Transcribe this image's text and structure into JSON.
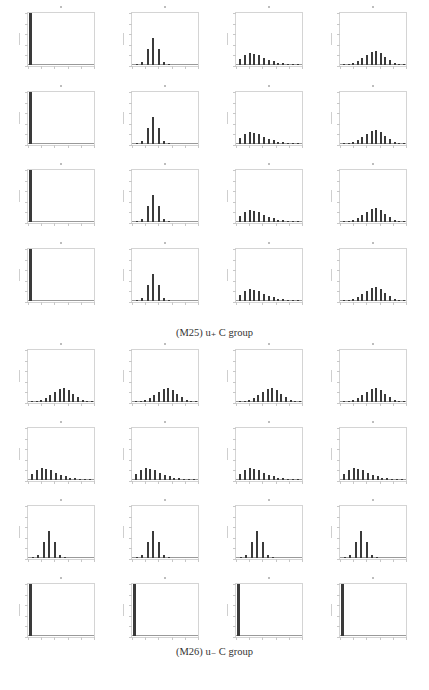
{
  "figure": {
    "captions": [
      {
        "label": "(M25) u₊ C group"
      },
      {
        "label": "(M26) u₋ C group"
      }
    ]
  },
  "chart_data": [
    {
      "type": "bar",
      "title": "(M25) u₊ C group",
      "layout": "4x4 grid of histogram panels",
      "grid": false,
      "ylim": [
        0,
        1
      ],
      "note": "Panel tick labels are illegible at this resolution; values are normalized bar heights estimated from pixels.",
      "rows": [
        {
          "panels": [
            {
              "shape": "spike-at-zero",
              "values": [
                1.0
              ]
            },
            {
              "shape": "narrow-peak",
              "values": [
                0.02,
                0.06,
                0.3,
                0.52,
                0.3,
                0.06,
                0.01
              ]
            },
            {
              "shape": "right-skewed-wide",
              "values": [
                0.12,
                0.2,
                0.23,
                0.22,
                0.19,
                0.14,
                0.1,
                0.07,
                0.04,
                0.03,
                0.02,
                0.02,
                0.01
              ]
            },
            {
              "shape": "centered-wide",
              "values": [
                0.01,
                0.02,
                0.03,
                0.07,
                0.13,
                0.2,
                0.25,
                0.27,
                0.23,
                0.16,
                0.09,
                0.04,
                0.02,
                0.01
              ]
            }
          ]
        },
        {
          "panels": [
            {
              "shape": "spike-at-zero",
              "values": [
                1.0
              ]
            },
            {
              "shape": "narrow-peak",
              "values": [
                0.02,
                0.06,
                0.3,
                0.52,
                0.3,
                0.06,
                0.01
              ]
            },
            {
              "shape": "right-skewed-wide",
              "values": [
                0.12,
                0.2,
                0.23,
                0.22,
                0.19,
                0.14,
                0.1,
                0.07,
                0.04,
                0.03,
                0.02,
                0.02,
                0.01
              ]
            },
            {
              "shape": "centered-wide",
              "values": [
                0.01,
                0.02,
                0.03,
                0.07,
                0.13,
                0.2,
                0.25,
                0.27,
                0.23,
                0.16,
                0.09,
                0.04,
                0.02,
                0.01
              ]
            }
          ]
        },
        {
          "panels": [
            {
              "shape": "spike-at-zero",
              "values": [
                1.0
              ]
            },
            {
              "shape": "narrow-peak",
              "values": [
                0.02,
                0.06,
                0.3,
                0.52,
                0.3,
                0.06,
                0.01
              ]
            },
            {
              "shape": "right-skewed-wide",
              "values": [
                0.12,
                0.2,
                0.23,
                0.22,
                0.19,
                0.14,
                0.1,
                0.07,
                0.04,
                0.03,
                0.02,
                0.02,
                0.01
              ]
            },
            {
              "shape": "centered-wide",
              "values": [
                0.01,
                0.02,
                0.03,
                0.07,
                0.13,
                0.2,
                0.25,
                0.27,
                0.23,
                0.16,
                0.09,
                0.04,
                0.02,
                0.01
              ]
            }
          ]
        },
        {
          "panels": [
            {
              "shape": "spike-at-zero",
              "values": [
                1.0
              ]
            },
            {
              "shape": "narrow-peak",
              "values": [
                0.02,
                0.06,
                0.3,
                0.52,
                0.3,
                0.06,
                0.01
              ]
            },
            {
              "shape": "right-skewed-wide",
              "values": [
                0.12,
                0.2,
                0.23,
                0.22,
                0.19,
                0.14,
                0.1,
                0.07,
                0.04,
                0.03,
                0.02,
                0.02,
                0.01
              ]
            },
            {
              "shape": "centered-wide",
              "values": [
                0.01,
                0.02,
                0.03,
                0.07,
                0.13,
                0.2,
                0.25,
                0.27,
                0.23,
                0.16,
                0.09,
                0.04,
                0.02,
                0.01
              ]
            }
          ]
        }
      ]
    },
    {
      "type": "bar",
      "title": "(M26) u₋ C group",
      "layout": "4x4 grid of histogram panels",
      "grid": false,
      "ylim": [
        0,
        1
      ],
      "note": "Panel tick labels are illegible at this resolution; values are normalized bar heights estimated from pixels.",
      "rows": [
        {
          "panels": [
            {
              "shape": "centered-wide",
              "values": [
                0.01,
                0.02,
                0.03,
                0.07,
                0.13,
                0.2,
                0.25,
                0.27,
                0.23,
                0.16,
                0.09,
                0.04,
                0.02,
                0.01
              ]
            },
            {
              "shape": "centered-wide",
              "values": [
                0.01,
                0.02,
                0.03,
                0.07,
                0.13,
                0.2,
                0.25,
                0.27,
                0.23,
                0.16,
                0.09,
                0.04,
                0.02,
                0.01
              ]
            },
            {
              "shape": "centered-wide",
              "values": [
                0.01,
                0.02,
                0.03,
                0.07,
                0.13,
                0.2,
                0.25,
                0.27,
                0.23,
                0.16,
                0.09,
                0.04,
                0.02,
                0.01
              ]
            },
            {
              "shape": "centered-wide",
              "values": [
                0.01,
                0.02,
                0.03,
                0.07,
                0.13,
                0.2,
                0.25,
                0.27,
                0.23,
                0.16,
                0.09,
                0.04,
                0.02,
                0.01
              ]
            }
          ]
        },
        {
          "panels": [
            {
              "shape": "right-skewed-wide",
              "values": [
                0.12,
                0.2,
                0.23,
                0.22,
                0.19,
                0.14,
                0.1,
                0.07,
                0.04,
                0.03,
                0.02,
                0.02,
                0.01
              ]
            },
            {
              "shape": "right-skewed-wide",
              "values": [
                0.12,
                0.2,
                0.23,
                0.22,
                0.19,
                0.14,
                0.1,
                0.07,
                0.04,
                0.03,
                0.02,
                0.02,
                0.01
              ]
            },
            {
              "shape": "right-skewed-wide",
              "values": [
                0.12,
                0.2,
                0.23,
                0.22,
                0.19,
                0.14,
                0.1,
                0.07,
                0.04,
                0.03,
                0.02,
                0.02,
                0.01
              ]
            },
            {
              "shape": "right-skewed-wide",
              "values": [
                0.12,
                0.2,
                0.23,
                0.22,
                0.19,
                0.14,
                0.1,
                0.07,
                0.04,
                0.03,
                0.02,
                0.02,
                0.01
              ]
            }
          ]
        },
        {
          "panels": [
            {
              "shape": "narrow-peak",
              "values": [
                0.02,
                0.06,
                0.3,
                0.52,
                0.3,
                0.06,
                0.01
              ]
            },
            {
              "shape": "narrow-peak",
              "values": [
                0.02,
                0.06,
                0.3,
                0.52,
                0.3,
                0.06,
                0.01
              ]
            },
            {
              "shape": "narrow-peak",
              "values": [
                0.02,
                0.06,
                0.3,
                0.52,
                0.3,
                0.06,
                0.01
              ]
            },
            {
              "shape": "narrow-peak",
              "values": [
                0.02,
                0.06,
                0.3,
                0.52,
                0.3,
                0.06,
                0.01
              ]
            }
          ]
        },
        {
          "panels": [
            {
              "shape": "spike-at-zero",
              "values": [
                1.0
              ]
            },
            {
              "shape": "spike-at-zero",
              "values": [
                1.0
              ]
            },
            {
              "shape": "spike-at-zero",
              "values": [
                1.0
              ]
            },
            {
              "shape": "spike-at-zero",
              "values": [
                1.0
              ]
            }
          ]
        }
      ]
    }
  ]
}
